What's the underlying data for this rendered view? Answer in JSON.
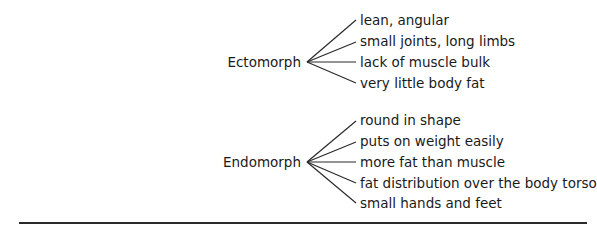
{
  "groups": [
    {
      "name": "Ectomorph",
      "traits": [
        "lean, angular",
        "small joints, long limbs",
        "lack of muscle bulk",
        "very little body fat"
      ]
    },
    {
      "name": "Endomorph",
      "traits": [
        "round in shape",
        "puts on weight easily",
        "more fat than muscle",
        "fat distribution over the body torso",
        "small hands and feet"
      ]
    }
  ]
}
